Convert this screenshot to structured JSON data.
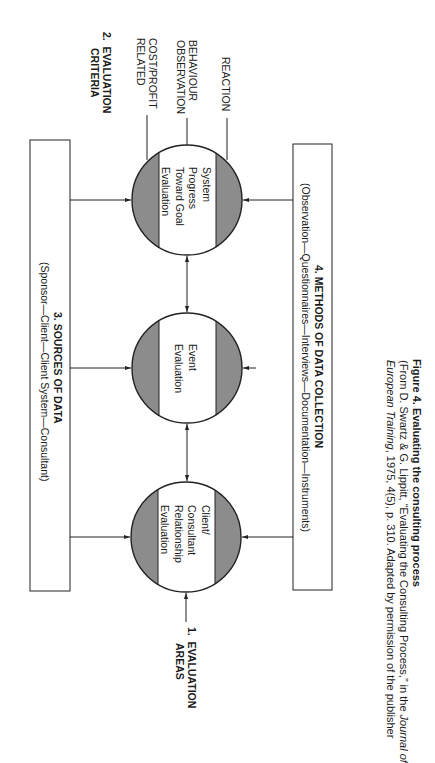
{
  "evaluation_areas": {
    "number": "1.",
    "label_line1": "EVALUATION",
    "label_line2": "AREAS"
  },
  "evaluation_criteria": {
    "number": "2.",
    "label_line1": "EVALUATION",
    "label_line2": "CRITERIA",
    "items": [
      {
        "line1": "COST/PROFIT",
        "line2": "RELATED"
      },
      {
        "line1": "BEHAVIOUR",
        "line2": "OBSERVATION"
      },
      {
        "line1": "REACTION",
        "line2": ""
      }
    ]
  },
  "sources_box": {
    "title": "3.  SOURCES OF DATA",
    "subtitle": "(Sponsor—Client—Client System—Consultant)"
  },
  "methods_box": {
    "title": "4.  METHODS OF DATA COLLECTION",
    "subtitle": "(Observation—Questionnaires—Interviews—Documentation—Instruments)"
  },
  "circles": [
    {
      "lines": [
        "Client/",
        "Consultant",
        "Relationship",
        "Evaluation"
      ]
    },
    {
      "lines": [
        "Event",
        "Evaluation"
      ]
    },
    {
      "lines": [
        "System",
        "Progress",
        "Toward Goal",
        "Evaluation"
      ]
    }
  ],
  "caption": {
    "title": "Figure 4.  Evaluating the consulting process",
    "line2": "(From D. Swartz & G. Lippitt, “Evaluating the Consulting Process,” in the ",
    "journal_part1": "Journal of",
    "journal_part2": "European Training",
    "line3_rest": ", 1975, 4(5), p. 310. Adapted by permission of the publisher"
  },
  "colors": {
    "circle_band": "#8c8c8c",
    "line": "#222222",
    "background": "#ffffff"
  }
}
